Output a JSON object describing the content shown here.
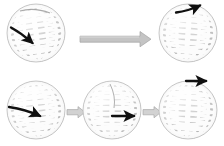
{
  "figure": {
    "background_color": "#ffffff",
    "width": 224,
    "height": 146,
    "sphere_fill": "#c8c8c8",
    "sphere_grid_color": "#ffffff",
    "sphere_shade_light": "#e8e8e8",
    "sphere_shade_dark": "#9a9a9a",
    "sphere_outline_color": "#b0b0b0",
    "vector_color": "#101010",
    "transition_arrow_color": "#bdbdbd",
    "transition_arrow_outline": "#9e9e9e"
  },
  "rows": [
    {
      "name": "top-row",
      "label": "",
      "spheres": [
        {
          "id": "sphere-top-left",
          "label": "",
          "cx": 36,
          "cy": 33,
          "r": 29,
          "vector": {
            "name": "tangent-vector",
            "label": "",
            "x1": 11,
            "y1": 28,
            "x2": 33,
            "y2": 44,
            "direction": "down-right"
          }
        },
        {
          "id": "sphere-top-right",
          "label": "",
          "cx": 188,
          "cy": 33,
          "r": 29,
          "vector": {
            "name": "tangent-vector",
            "label": "",
            "x1": 175,
            "y1": 12,
            "x2": 203,
            "y2": 4,
            "direction": "up-right"
          }
        }
      ],
      "transitions": [
        {
          "id": "transition-arrow-top",
          "label": "",
          "x1": 80,
          "y1": 39,
          "x2": 145,
          "y2": 39,
          "size": "large"
        }
      ]
    },
    {
      "name": "bottom-row",
      "label": "",
      "spheres": [
        {
          "id": "sphere-bottom-left",
          "label": "",
          "cx": 36,
          "cy": 110,
          "r": 29,
          "vector": {
            "name": "tangent-vector",
            "label": "",
            "x1": 9,
            "y1": 108,
            "x2": 44,
            "y2": 117,
            "direction": "right"
          }
        },
        {
          "id": "sphere-bottom-middle",
          "label": "",
          "cx": 112,
          "cy": 110,
          "r": 29,
          "vector": {
            "name": "tangent-vector",
            "label": "",
            "x1": 112,
            "y1": 116,
            "x2": 139,
            "y2": 116,
            "direction": "right"
          }
        },
        {
          "id": "sphere-bottom-right",
          "label": "",
          "cx": 188,
          "cy": 110,
          "r": 29,
          "vector": {
            "name": "tangent-vector",
            "label": "",
            "x1": 185,
            "y1": 81,
            "x2": 211,
            "y2": 81,
            "direction": "right"
          }
        }
      ],
      "transitions": [
        {
          "id": "transition-arrow-bottom-1",
          "label": "",
          "x1": 66,
          "y1": 112,
          "x2": 84,
          "y2": 112,
          "size": "small"
        },
        {
          "id": "transition-arrow-bottom-2",
          "label": "",
          "x1": 142,
          "y1": 112,
          "x2": 160,
          "y2": 112,
          "size": "small"
        }
      ]
    }
  ]
}
